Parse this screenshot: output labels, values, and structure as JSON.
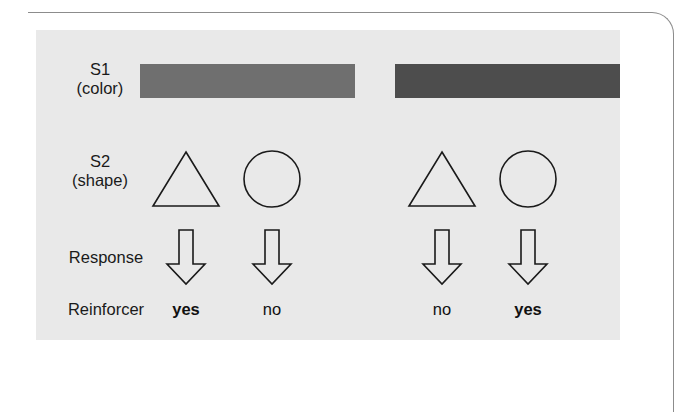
{
  "figure": {
    "panel_background": "#e9e9e9",
    "border_color": "#8c8c8c",
    "rows": [
      {
        "key": "s1",
        "label": "S1",
        "sublabel": "(color)",
        "type": "color-bars"
      },
      {
        "key": "s2",
        "label": "S2",
        "sublabel": "(shape)",
        "type": "shapes"
      },
      {
        "key": "response",
        "label": "Response",
        "sublabel": "",
        "type": "arrows"
      },
      {
        "key": "reinforcer",
        "label": "Reinforcer",
        "sublabel": "",
        "type": "text"
      }
    ],
    "s1_bars": [
      {
        "name": "color-bar-left",
        "color": "#6f6f6f"
      },
      {
        "name": "color-bar-right",
        "color": "#4d4d4d"
      }
    ],
    "columns": [
      {
        "shape": "triangle",
        "shape_icon": "triangle-outline-icon",
        "arrow_icon": "down-arrow-outline-icon",
        "reinforcer": "yes",
        "emphasis": true
      },
      {
        "shape": "circle",
        "shape_icon": "circle-outline-icon",
        "arrow_icon": "down-arrow-outline-icon",
        "reinforcer": "no",
        "emphasis": false
      },
      {
        "shape": "triangle",
        "shape_icon": "triangle-outline-icon",
        "arrow_icon": "down-arrow-outline-icon",
        "reinforcer": "no",
        "emphasis": false
      },
      {
        "shape": "circle",
        "shape_icon": "circle-outline-icon",
        "arrow_icon": "down-arrow-outline-icon",
        "reinforcer": "yes",
        "emphasis": true
      }
    ],
    "stroke_color": "#1a1a1a"
  }
}
